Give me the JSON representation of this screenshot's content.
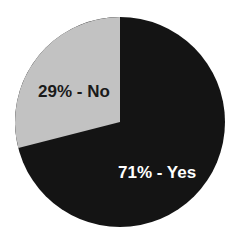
{
  "chart_data": {
    "type": "pie",
    "title": "",
    "categories": [
      "Yes",
      "No"
    ],
    "values": [
      71,
      29
    ],
    "labels": [
      "71% - Yes",
      "29% - No"
    ],
    "colors": [
      "#141414",
      "#c2c2c2"
    ],
    "label_colors": [
      "#ffffff",
      "#1a1a1a"
    ],
    "legend": "none",
    "start_angle": "12 o'clock, No slice counterclockwise"
  }
}
